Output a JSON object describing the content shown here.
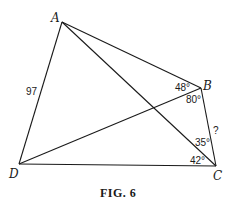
{
  "figure": {
    "caption": "FIG. 6",
    "vertices": {
      "A": "A",
      "B": "B",
      "C": "C",
      "D": "D"
    },
    "side_labels": {
      "AD": "97",
      "BC": "?"
    },
    "angle_labels": {
      "ABD": "48°",
      "DBC": "80°",
      "ACB": "35°",
      "ACD": "42°"
    },
    "segments": [
      "AB",
      "AC",
      "AD",
      "BC",
      "BD",
      "CD"
    ]
  }
}
